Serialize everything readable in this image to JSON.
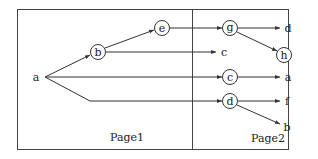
{
  "pages": [
    {
      "label": "Page1"
    },
    {
      "label": "Page2"
    }
  ],
  "nodes": {
    "root": {
      "label": "a"
    },
    "b": {
      "label": "b"
    },
    "e": {
      "label": "e"
    },
    "g": {
      "label": "g"
    },
    "h": {
      "label": "h"
    },
    "c": {
      "label": "c"
    },
    "d": {
      "label": "d"
    }
  },
  "leaves": {
    "g_d": {
      "label": "d"
    },
    "b_c": {
      "label": "c"
    },
    "c_a": {
      "label": "a"
    },
    "d_f": {
      "label": "f"
    },
    "d_b": {
      "label": "b"
    }
  },
  "edges": [
    {
      "from": "a",
      "to": "b"
    },
    {
      "from": "b",
      "to": "e"
    },
    {
      "from": "b",
      "to": "c"
    },
    {
      "from": "a",
      "to": "c"
    },
    {
      "from": "a",
      "to": "d"
    },
    {
      "from": "e",
      "to": "g"
    },
    {
      "from": "g",
      "to": "d"
    },
    {
      "from": "g",
      "to": "h"
    },
    {
      "from": "c",
      "to": "a"
    },
    {
      "from": "d",
      "to": "f"
    },
    {
      "from": "d",
      "to": "b"
    }
  ]
}
